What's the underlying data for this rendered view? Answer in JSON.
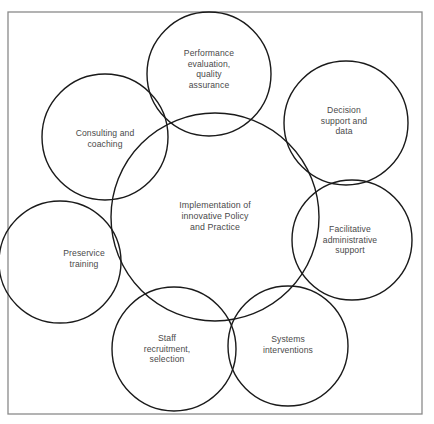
{
  "diagram": {
    "type": "overlapping-circles",
    "frame": {
      "x": 8,
      "y": 12,
      "width": 414,
      "height": 402,
      "stroke": "#8a8a8a"
    },
    "center": {
      "label": "Implementation of\ninnovative Policy\nand Practice",
      "cx": 215,
      "cy": 217,
      "r": 104
    },
    "satellites": [
      {
        "id": "performance",
        "label": "Performance\nevaluation,\nquality\nassurance",
        "cx": 209,
        "cy": 74,
        "r": 62,
        "tx": 209,
        "ty": 69
      },
      {
        "id": "decision",
        "label": "Decision\nsupport and\ndata",
        "cx": 346,
        "cy": 123,
        "r": 62,
        "tx": 344,
        "ty": 121
      },
      {
        "id": "facilitative",
        "label": "Facilitative\nadministrative\nsupport",
        "cx": 352,
        "cy": 240,
        "r": 60,
        "tx": 350,
        "ty": 240
      },
      {
        "id": "systems",
        "label": "Systems\ninterventions",
        "cx": 288,
        "cy": 346,
        "r": 60,
        "tx": 288,
        "ty": 345
      },
      {
        "id": "staff",
        "label": "Staff\nrecruitment,\nselection",
        "cx": 174,
        "cy": 349,
        "r": 62,
        "tx": 167,
        "ty": 349
      },
      {
        "id": "preservice",
        "label": "Preservice\ntraining",
        "cx": 60,
        "cy": 262,
        "r": 61,
        "tx": 84,
        "ty": 259
      },
      {
        "id": "consulting",
        "label": "Consulting and\ncoaching",
        "cx": 105,
        "cy": 137,
        "r": 63,
        "tx": 105,
        "ty": 139
      }
    ],
    "colors": {
      "stroke": "#1a1a1a",
      "text": "#4a4a4a",
      "background": "#ffffff"
    }
  }
}
